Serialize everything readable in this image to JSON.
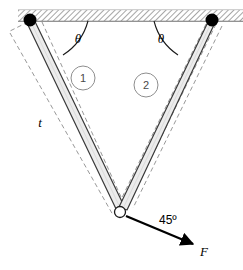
{
  "figure": {
    "background_color": "#ffffff",
    "line_color": "#1a1a1a",
    "bar_fill_color": "#ececec",
    "dashed_color": "#8c8c8c",
    "pin_color": "#000000",
    "hatch_color": "#9a9a9a"
  },
  "ceiling": {
    "name": "fixed-support",
    "hatch_label": "hatched-ceiling"
  },
  "supports": {
    "left_pin": {
      "label": "left-pin-joint",
      "cx": 30,
      "cy": 20,
      "r": 6.5
    },
    "right_pin": {
      "label": "right-pin-joint",
      "cx": 212,
      "cy": 20,
      "r": 6.5
    },
    "bottom_joint": {
      "label": "bottom-pin-joint",
      "cx": 120,
      "cy": 212,
      "r": 5.5
    }
  },
  "bars": [
    {
      "id": "1",
      "number_label": "1",
      "circle_cx": 83,
      "circle_cy": 78,
      "circle_r": 12
    },
    {
      "id": "2",
      "number_label": "2",
      "circle_cx": 146,
      "circle_cy": 85,
      "circle_r": 12
    }
  ],
  "angles": {
    "left_theta": {
      "label": "θ",
      "x": 78,
      "y": 38
    },
    "right_theta": {
      "label": "θ",
      "x": 161,
      "y": 38
    },
    "force_angle": {
      "label": "45º",
      "x": 159,
      "y": 222
    }
  },
  "labels": {
    "length_t": {
      "label": "t",
      "x": 40,
      "y": 127
    },
    "force_f": {
      "label": "F",
      "x": 204,
      "y": 253
    }
  },
  "force": {
    "name": "applied-force-arrow",
    "from_x": 126,
    "from_y": 216,
    "to_x": 197,
    "to_y": 246,
    "direction_degrees": 45
  }
}
